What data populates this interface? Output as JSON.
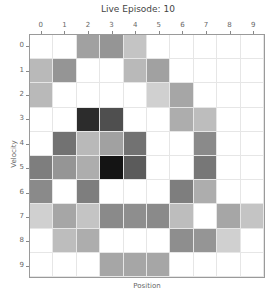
{
  "chart_data": {
    "type": "heatmap",
    "title": "Live Episode: 10",
    "xlabel": "Position",
    "ylabel": "Velocity",
    "x_ticks": [
      "0",
      "1",
      "2",
      "3",
      "4",
      "5",
      "6",
      "7",
      "8",
      "9"
    ],
    "y_ticks": [
      "0",
      "1",
      "2",
      "3",
      "4",
      "5",
      "6",
      "7",
      "8",
      "9"
    ],
    "x_axis_position": "top",
    "colormap": "greys",
    "value_range": [
      0,
      1
    ],
    "grid": true,
    "values": [
      [
        0,
        0,
        0.4,
        0.45,
        0.25,
        0,
        0,
        0,
        0,
        0
      ],
      [
        0.3,
        0.45,
        0,
        0,
        0.3,
        0.4,
        0,
        0,
        0,
        0
      ],
      [
        0.3,
        0,
        0,
        0,
        0,
        0.2,
        0.38,
        0,
        0,
        0
      ],
      [
        0,
        0,
        0.9,
        0.75,
        0,
        0,
        0.35,
        0.28,
        0,
        0
      ],
      [
        0,
        0.6,
        0.3,
        0.4,
        0.6,
        0,
        0,
        0.5,
        0,
        0
      ],
      [
        0.55,
        0.45,
        0.35,
        1.0,
        0.7,
        0,
        0,
        0.58,
        0,
        0
      ],
      [
        0.5,
        0,
        0.55,
        0,
        0,
        0,
        0.55,
        0.35,
        0,
        0
      ],
      [
        0.2,
        0.38,
        0.25,
        0.5,
        0.48,
        0.5,
        0.28,
        0,
        0.38,
        0.25
      ],
      [
        0,
        0.28,
        0.35,
        0,
        0,
        0,
        0.48,
        0.45,
        0.2,
        0
      ],
      [
        0,
        0,
        0,
        0.38,
        0.38,
        0.38,
        0,
        0,
        0,
        0
      ]
    ]
  }
}
